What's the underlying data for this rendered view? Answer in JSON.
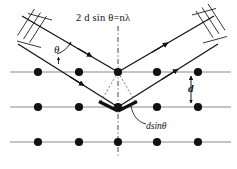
{
  "figure": {
    "background_color": "#ffffff",
    "ink_color": "#111111",
    "lattice_line_color": "#8a8a8a",
    "width": 237,
    "height": 169
  },
  "labels": {
    "equation": "2 d sin θ=nλ",
    "incidence_angle": "θ",
    "interplanar_spacing": "d",
    "path_difference": "dsinθ"
  },
  "lattice": {
    "rows": 3,
    "atoms_per_row": 5,
    "row_y": [
      72,
      107,
      142
    ],
    "atom_x": [
      38,
      79,
      118,
      157,
      198
    ],
    "atom_radius": 4.1,
    "atom_color": "#111111",
    "plane_line_color": "#8a8a8a"
  },
  "beams": {
    "incoming_label": "incident x-ray beam",
    "outgoing_label": "diffracted x-ray beam",
    "arrow_color": "#111111",
    "wavefront_ticks_per_beam": 3,
    "upper_ray": {
      "incoming_from": [
        22,
        16
      ],
      "scatter_at": [
        118,
        72
      ],
      "outgoing_to": [
        214,
        16
      ]
    },
    "lower_ray": {
      "incoming_from": [
        18,
        44
      ],
      "scatter_at": [
        118,
        107
      ],
      "outgoing_to": [
        218,
        44
      ]
    }
  },
  "construction": {
    "center_axis": "vertical dash-dot normal through scattering centers",
    "center_axis_x": 118,
    "center_axis_top": 26,
    "center_axis_bottom": 156,
    "path_difference_segments": "bold V segments marking d sinθ on each side",
    "dashed_projection_lines": "thin dashed lines from upper scattering atom to path-difference feet",
    "d_arrow": "double-headed vertical arrow between row 1 and row 2 at x=191",
    "leader_line": "curved leader from path-difference vertex to dsinθ label"
  }
}
